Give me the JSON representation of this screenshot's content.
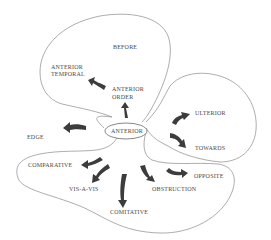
{
  "diagram": {
    "center": "ANTERIOR",
    "regions": {
      "before": {
        "title": "BEFORE",
        "nodes": [
          "ANTERIOR TEMPORAL",
          "ANTERIOR ORDER"
        ]
      },
      "ulterior_towards": {
        "nodes": [
          "ULTERIOR",
          "TOWARDS"
        ]
      },
      "lower": {
        "nodes": [
          "COMPARATIVE",
          "VIS-A-VIS",
          "COMITATIVE",
          "OBSTRUCTION",
          "OPPOSITE"
        ]
      },
      "outside": {
        "nodes": [
          "EDGE"
        ]
      }
    },
    "labels": {
      "before": "BEFORE",
      "anterior_temporal_1": "ANTERIOR",
      "anterior_temporal_2": "TEMPORAL",
      "anterior_order_1": "ANTERIOR",
      "anterior_order_2": "ORDER",
      "center": "ANTERIOR",
      "edge": "EDGE",
      "ulterior": "ULTERIOR",
      "towards": "TOWARDS",
      "comparative": "COMPARATIVE",
      "vis_a_vis": "VIS-A-VIS",
      "comitative": "COMITATIVE",
      "obstruction": "OBSTRUCTION",
      "opposite": "OPPOSITE"
    },
    "colors": {
      "outline": "#8a8a8a",
      "arrow": "#3c3c3c",
      "text": "#4a4a4a"
    }
  }
}
